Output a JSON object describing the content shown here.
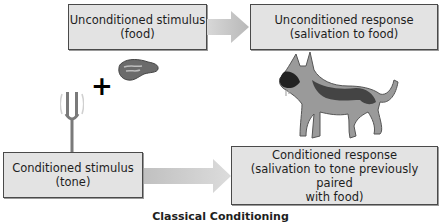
{
  "diagram": {
    "caption": "Classical Conditioning",
    "unconditioned_stimulus": {
      "line1": "Unconditioned stimulus",
      "line2": "(food)"
    },
    "unconditioned_response": {
      "line1": "Unconditioned response",
      "line2": "(salivation to food)"
    },
    "conditioned_stimulus": {
      "line1": "Conditioned stimulus",
      "line2": "(tone)"
    },
    "conditioned_response": {
      "line1": "Conditioned response",
      "line2": "(salivation to tone previously paired",
      "line3": "with food)"
    },
    "plus_symbol": "+",
    "icons": [
      "meat-icon",
      "tuning-fork-icon",
      "dog-icon",
      "arrow-right-icon"
    ],
    "colors": {
      "box_fill": "#e3e3e3",
      "box_border": "#4a4a4a",
      "arrow": "#c4c4c4"
    }
  }
}
